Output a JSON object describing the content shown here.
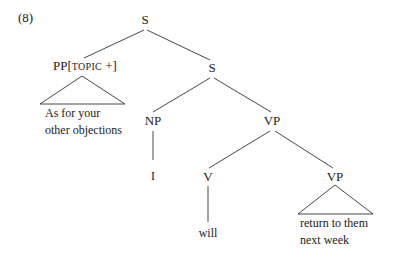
{
  "example_number": "(8)",
  "tree": {
    "root": "S",
    "topic": {
      "category": "PP",
      "feature_open": "[",
      "feature": "TOPIC",
      "feature_value": " +]",
      "text_line1": "As for your",
      "text_line2": "other objections"
    },
    "inner_s": "S",
    "subject": {
      "category": "NP",
      "word": "I"
    },
    "vp": {
      "category": "VP",
      "verb": {
        "category": "V",
        "word": "will"
      },
      "complement": {
        "category": "VP",
        "text_line1": "return to them",
        "text_line2": "next week"
      }
    }
  },
  "colors": {
    "line": "#333333",
    "text": "#222222"
  }
}
